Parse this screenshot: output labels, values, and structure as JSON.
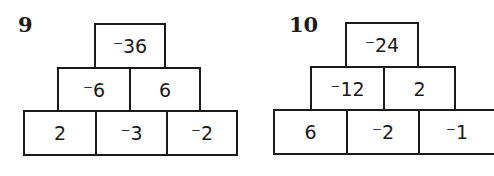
{
  "pyramids": [
    {
      "number": "9",
      "top": [
        "⁻36"
      ],
      "middle": [
        "⁻6",
        "6"
      ],
      "bottom": [
        "2",
        "⁻3",
        "⁻2"
      ]
    },
    {
      "number": "10",
      "top": [
        "⁻24"
      ],
      "middle": [
        "⁻12",
        "2"
      ],
      "bottom": [
        "6",
        "⁻2",
        "⁻1"
      ]
    }
  ]
}
